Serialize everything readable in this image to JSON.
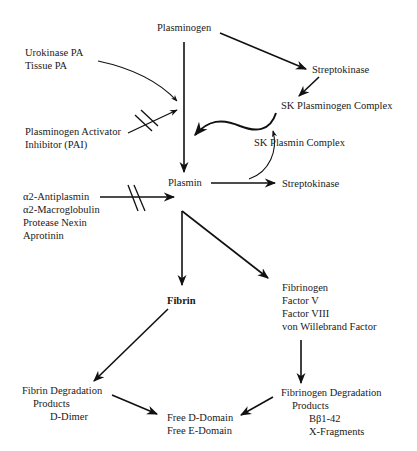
{
  "diagram": {
    "nodes": {
      "plasminogen": "Plasminogen",
      "activators": [
        "Urokinase PA",
        "Tissue PA"
      ],
      "pai": [
        "Plasminogen Activator",
        "Inhibitor (PAI)"
      ],
      "streptokinase_top": "Streptokinase",
      "sk_plasminogen_complex": "SK Plasminogen Complex",
      "sk_plasmin_complex": "SK Plasmin Complex",
      "plasmin": "Plasmin",
      "streptokinase_right": "Streptokinase",
      "inhibitors": [
        "α2-Antiplasmin",
        "α2-Macroglobulin",
        "Protease Nexin",
        "Aprotinin"
      ],
      "fibrin": "Fibrin",
      "substrates": [
        "Fibrinogen",
        "Factor V",
        "Factor VIII",
        "von Willebrand Factor"
      ],
      "fdp": [
        "Fibrin Degradation",
        "Products",
        "D-Dimer"
      ],
      "free_domains": [
        "Free D-Domain",
        "Free E-Domain"
      ],
      "fgdp": [
        "Fibrinogen Degradation",
        "Products",
        "Bβ1-42",
        "X-Fragments"
      ]
    },
    "edges": [
      {
        "from": "plasminogen",
        "to": "plasmin",
        "type": "activation"
      },
      {
        "from": "plasminogen",
        "to": "streptokinase_top",
        "type": "binding"
      },
      {
        "from": "activators",
        "to": "plasmin",
        "type": "activation"
      },
      {
        "from": "pai",
        "to": "plasmin",
        "type": "inhibition"
      },
      {
        "from": "streptokinase_top",
        "to": "sk_plasminogen_complex",
        "type": "conversion"
      },
      {
        "from": "sk_plasminogen_complex",
        "to": "plasmin",
        "type": "activation"
      },
      {
        "from": "plasmin",
        "to": "sk_plasmin_complex",
        "type": "conversion"
      },
      {
        "from": "plasmin",
        "to": "streptokinase_right",
        "type": "conversion"
      },
      {
        "from": "inhibitors",
        "to": "plasmin",
        "type": "inhibition"
      },
      {
        "from": "plasmin",
        "to": "fibrin",
        "type": "cleavage"
      },
      {
        "from": "plasmin",
        "to": "substrates",
        "type": "cleavage"
      },
      {
        "from": "fibrin",
        "to": "fdp",
        "type": "degradation"
      },
      {
        "from": "substrates",
        "to": "fgdp",
        "type": "degradation"
      },
      {
        "from": "fdp",
        "to": "free_domains",
        "type": "degradation"
      },
      {
        "from": "fgdp",
        "to": "free_domains",
        "type": "degradation"
      }
    ]
  }
}
